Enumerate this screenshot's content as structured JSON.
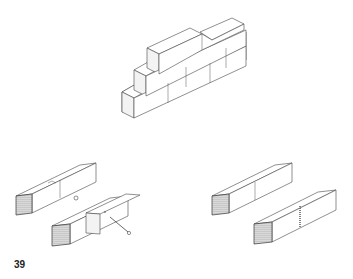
{
  "page": {
    "number": "39"
  },
  "figures": [
    {
      "id": "brick-wall",
      "description": "Isometric stepped brick wall of three courses"
    },
    {
      "id": "bolted-timber-joint",
      "description": "Two timber beams with notched joint and bolt connection"
    },
    {
      "id": "butt-timber-joint",
      "description": "Two timber beams with butt joint and glued/plated joint"
    }
  ]
}
